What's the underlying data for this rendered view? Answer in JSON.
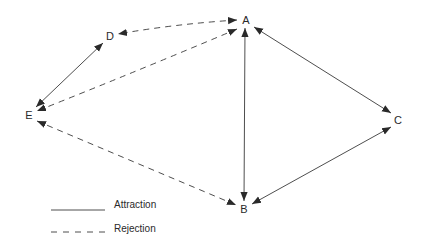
{
  "diagram": {
    "type": "sociogram",
    "colors": {
      "line": "#3a3a3a",
      "text": "#2a2a2a",
      "background": "#ffffff"
    },
    "nodes": [
      {
        "id": "A",
        "label": "A",
        "x": 245,
        "y": 20
      },
      {
        "id": "B",
        "label": "B",
        "x": 244,
        "y": 209
      },
      {
        "id": "C",
        "label": "C",
        "x": 398,
        "y": 120
      },
      {
        "id": "D",
        "label": "D",
        "x": 110,
        "y": 36
      },
      {
        "id": "E",
        "label": "E",
        "x": 29,
        "y": 115
      }
    ],
    "edges": [
      {
        "from": "D",
        "to": "E",
        "type": "attraction",
        "arrows": "both"
      },
      {
        "from": "A",
        "to": "B",
        "type": "attraction",
        "arrows": "both"
      },
      {
        "from": "A",
        "to": "C",
        "type": "attraction",
        "arrows": "both"
      },
      {
        "from": "B",
        "to": "C",
        "type": "attraction",
        "arrows": "both"
      },
      {
        "from": "A",
        "to": "D",
        "type": "rejection",
        "arrows": "both"
      },
      {
        "from": "A",
        "to": "E",
        "type": "rejection",
        "arrows": "both"
      },
      {
        "from": "E",
        "to": "B",
        "type": "rejection",
        "arrows": "both"
      }
    ],
    "legend": {
      "items": [
        {
          "label": "Attraction",
          "style": "solid"
        },
        {
          "label": "Rejection",
          "style": "dashed"
        }
      ]
    }
  }
}
